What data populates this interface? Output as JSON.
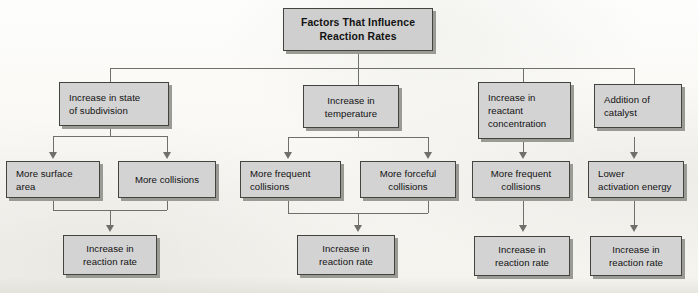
{
  "diagram": {
    "title_box": {
      "label": "Factors That Influence\nReaction Rates"
    },
    "level2": [
      {
        "id": "subdivision",
        "label": "Increase in state\nof subdivision"
      },
      {
        "id": "temperature",
        "label": "Increase in\ntemperature"
      },
      {
        "id": "concentration",
        "label": "Increase in\nreactant\nconcentration"
      },
      {
        "id": "catalyst",
        "label": "Addition of\ncatalyst"
      }
    ],
    "level3": [
      {
        "id": "surface-area",
        "label": "More surface\narea"
      },
      {
        "id": "more-collisions",
        "label": "More collisions"
      },
      {
        "id": "frequent-collisions",
        "label": "More frequent\ncollisions"
      },
      {
        "id": "forceful-collisions",
        "label": "More forceful\ncollisions"
      },
      {
        "id": "frequent-collisions-2",
        "label": "More frequent\ncollisions"
      },
      {
        "id": "lower-activation",
        "label": "Lower\nactivation energy"
      }
    ],
    "level4": [
      {
        "id": "rate-1",
        "label": "Increase in\nreaction rate"
      },
      {
        "id": "rate-2",
        "label": "Increase in\nreaction rate"
      },
      {
        "id": "rate-3",
        "label": "Increase in\nreaction rate"
      },
      {
        "id": "rate-4",
        "label": "Increase in\nreaction rate"
      }
    ],
    "colors": {
      "box_fill": "#d3d3d3",
      "box_border": "#44443f",
      "box_shadow": "#9b9b96",
      "connector": "#70706b",
      "page_background": "#fcfbf9",
      "text": "#121212"
    }
  }
}
